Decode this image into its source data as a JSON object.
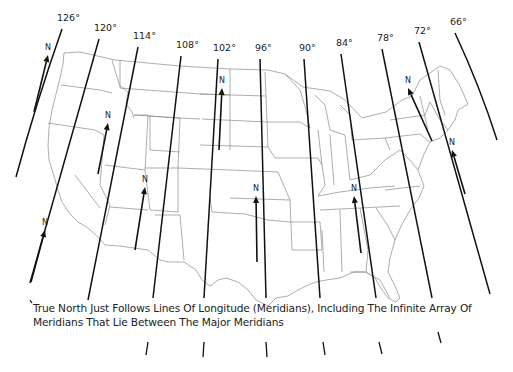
{
  "map": {
    "title": "Meridians of longitude across the contiguous United States",
    "background": "#ffffff",
    "line_color": "#111111",
    "border_color": "#777777",
    "meridians": [
      {
        "label": "126°",
        "x1": 62,
        "y1": 29,
        "x2": 16,
        "y2": 177
      },
      {
        "label": "120°",
        "x1": 99,
        "y1": 39,
        "x2": 30,
        "y2": 283
      },
      {
        "label": "114°",
        "x1": 138,
        "y1": 47,
        "x2": 88,
        "y2": 300
      },
      {
        "label": "108°",
        "x1": 181,
        "y1": 56,
        "x2": 153,
        "y2": 298
      },
      {
        "label": "102°",
        "x1": 218,
        "y1": 59,
        "x2": 204,
        "y2": 298
      },
      {
        "label": "96°",
        "x1": 260,
        "y1": 59,
        "x2": 266,
        "y2": 298
      },
      {
        "label": "90°",
        "x1": 304,
        "y1": 59,
        "x2": 320,
        "y2": 298
      },
      {
        "label": "84°",
        "x1": 341,
        "y1": 54,
        "x2": 376,
        "y2": 298
      },
      {
        "label": "78°",
        "x1": 382,
        "y1": 49,
        "x2": 432,
        "y2": 298
      },
      {
        "label": "72°",
        "x1": 419,
        "y1": 42,
        "x2": 490,
        "y2": 294
      },
      {
        "label": "66°",
        "x1": 455,
        "y1": 33,
        "x2": 497,
        "y2": 140
      }
    ],
    "meridian_extensions": [
      {
        "x1": 148,
        "y1": 342,
        "x2": 146,
        "y2": 355
      },
      {
        "x1": 204,
        "y1": 342,
        "x2": 203,
        "y2": 357
      },
      {
        "x1": 266,
        "y1": 342,
        "x2": 267,
        "y2": 357
      },
      {
        "x1": 323,
        "y1": 342,
        "x2": 325,
        "y2": 355
      },
      {
        "x1": 379,
        "y1": 342,
        "x2": 382,
        "y2": 354
      },
      {
        "x1": 438,
        "y1": 332,
        "x2": 441,
        "y2": 343
      },
      {
        "x1": 30,
        "y1": 300,
        "x2": 32,
        "y2": 303
      }
    ],
    "north_arrows": [
      {
        "label": "N",
        "x1": 34,
        "y1": 112,
        "x2": 48,
        "y2": 55
      },
      {
        "label": "N",
        "x1": 98,
        "y1": 174,
        "x2": 108,
        "y2": 123
      },
      {
        "label": "N",
        "x1": 219,
        "y1": 150,
        "x2": 222,
        "y2": 88
      },
      {
        "label": "N",
        "x1": 432,
        "y1": 141,
        "x2": 408,
        "y2": 88
      },
      {
        "label": "N",
        "x1": 465,
        "y1": 194,
        "x2": 452,
        "y2": 150
      },
      {
        "label": "N",
        "x1": 135,
        "y1": 250,
        "x2": 145,
        "y2": 187
      },
      {
        "label": "N",
        "x1": 31,
        "y1": 282,
        "x2": 45,
        "y2": 230
      },
      {
        "label": "N",
        "x1": 257,
        "y1": 262,
        "x2": 256,
        "y2": 196
      },
      {
        "label": "N",
        "x1": 361,
        "y1": 253,
        "x2": 354,
        "y2": 196
      }
    ]
  },
  "caption": {
    "line1": "True North Just Follows Lines Of Longitude (Meridians), Including The Infinite Array Of",
    "line2": "Meridians That Lie Between The Major Meridians"
  }
}
